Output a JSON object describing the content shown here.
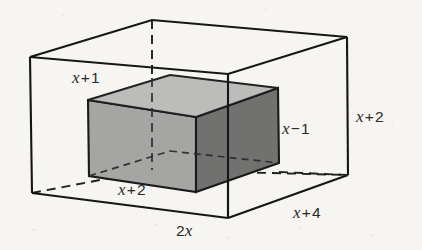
{
  "figure": {
    "background_color": "#f6f5f2",
    "line_color": "#1c1c1c",
    "outer_box": {
      "name": "outer transparent box",
      "edge_labels": {
        "height": {
          "text": "x + 2",
          "var": "x",
          "op": "+",
          "num": "2"
        },
        "width": {
          "text": "2x",
          "var": "x",
          "op": "",
          "num": "2"
        },
        "depth": {
          "text": "x + 4",
          "var": "x",
          "op": "+",
          "num": "4"
        }
      }
    },
    "inner_box": {
      "name": "inner shaded solid prism",
      "fill_top": "#b5b5b3",
      "fill_front": "#a3a3a1",
      "fill_right": "#777775",
      "edge_labels": {
        "height": {
          "text": "x − 1",
          "var": "x",
          "op": "−",
          "num": "1"
        },
        "width": {
          "text": "x + 2",
          "var": "x",
          "op": "+",
          "num": "2"
        },
        "depth": {
          "text": "x + 1",
          "var": "x",
          "op": "+",
          "num": "1"
        }
      }
    },
    "labels": {
      "outer_height": "x + 2",
      "outer_width": "2x",
      "outer_depth": "x + 4",
      "inner_height": "x − 1",
      "inner_width": "x + 2",
      "inner_depth": "x + 1"
    },
    "label_parts": {
      "outer_height": {
        "var": "x",
        "op": "+",
        "num": "2"
      },
      "outer_width": {
        "coef": "2",
        "var": "x"
      },
      "outer_depth": {
        "var": "x",
        "op": "+",
        "num": "4"
      },
      "inner_height": {
        "var": "x",
        "op": "−",
        "num": "1"
      },
      "inner_width": {
        "var": "x",
        "op": "+",
        "num": "2"
      },
      "inner_depth": {
        "var": "x",
        "op": "+",
        "num": "1"
      }
    }
  }
}
